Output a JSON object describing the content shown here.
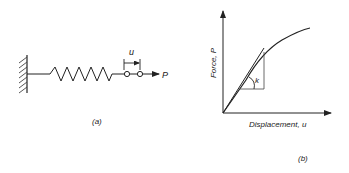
{
  "figure_a": {
    "caption": "(a)",
    "displacement_label": "u",
    "force_label": "P",
    "components": [
      "fixed-wall",
      "spring",
      "node-1",
      "node-2",
      "force-arrow"
    ]
  },
  "figure_b": {
    "caption": "(b)",
    "y_axis_label": "Force, P",
    "x_axis_label": "Displacement, u",
    "stiffness_label": "k"
  },
  "colors": {
    "stroke": "#222222",
    "background": "#ffffff"
  }
}
